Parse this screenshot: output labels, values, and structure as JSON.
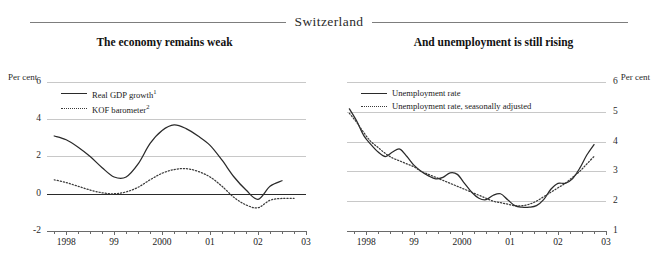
{
  "banner": {
    "country": "Switzerland"
  },
  "panels": [
    {
      "id": "left",
      "title": "The economy remains weak",
      "unit_label": "Per cent",
      "legend": [
        {
          "style": "solid",
          "label": "Real GDP growth",
          "footnote": "1"
        },
        {
          "style": "dotted",
          "label": "KOF barometer",
          "footnote": "2"
        }
      ]
    },
    {
      "id": "right",
      "title": "And unemployment is still rising",
      "unit_label": "Per cent",
      "legend": [
        {
          "style": "solid",
          "label": "Unemployment rate",
          "footnote": ""
        },
        {
          "style": "dotted",
          "label": "Unemployment rate, seasonally adjusted",
          "footnote": ""
        }
      ]
    }
  ],
  "chart_data": [
    {
      "type": "line",
      "title": "The economy remains weak",
      "xlabel": "",
      "ylabel": "Per cent",
      "ylim": [
        -2,
        6
      ],
      "yticks": [
        6,
        4,
        2,
        0,
        -2
      ],
      "xlim": [
        1997.6,
        2003.0
      ],
      "xticks": [
        1998,
        1999,
        2000,
        2001,
        2002,
        2003
      ],
      "xticklabels": [
        "1998",
        "99",
        "2000",
        "01",
        "02",
        "03"
      ],
      "grid": true,
      "zero_line": 0,
      "legend_position": "upper-left",
      "series": [
        {
          "name": "Real GDP growth",
          "style": "solid",
          "x": [
            1997.75,
            1998.0,
            1998.25,
            1998.5,
            1998.75,
            1999.0,
            1999.25,
            1999.5,
            1999.75,
            2000.0,
            2000.25,
            2000.5,
            2000.75,
            2001.0,
            2001.25,
            2001.5,
            2001.75,
            2002.0,
            2002.25,
            2002.5
          ],
          "y": [
            3.1,
            2.9,
            2.5,
            2.0,
            1.4,
            0.9,
            0.9,
            1.6,
            2.7,
            3.4,
            3.7,
            3.5,
            3.1,
            2.6,
            1.8,
            0.9,
            0.2,
            -0.3,
            0.4,
            0.7
          ]
        },
        {
          "name": "KOF barometer",
          "style": "dotted",
          "x": [
            1997.75,
            1998.0,
            1998.25,
            1998.5,
            1998.75,
            1999.0,
            1999.25,
            1999.5,
            1999.75,
            2000.0,
            2000.25,
            2000.5,
            2000.75,
            2001.0,
            2001.25,
            2001.5,
            2001.75,
            2002.0,
            2002.25,
            2002.5,
            2002.75
          ],
          "y": [
            0.75,
            0.6,
            0.4,
            0.2,
            0.05,
            0.0,
            0.1,
            0.35,
            0.75,
            1.1,
            1.3,
            1.35,
            1.2,
            0.9,
            0.4,
            -0.2,
            -0.6,
            -0.75,
            -0.35,
            -0.25,
            -0.25
          ]
        }
      ]
    },
    {
      "type": "line",
      "title": "And unemployment is still rising",
      "xlabel": "",
      "ylabel": "Per cent",
      "ylim": [
        1,
        6
      ],
      "yticks": [
        6,
        5,
        4,
        3,
        2,
        1
      ],
      "xlim": [
        1997.6,
        2003.0
      ],
      "xticks": [
        1998,
        1999,
        2000,
        2001,
        2002,
        2003
      ],
      "xticklabels": [
        "1998",
        "99",
        "2000",
        "01",
        "02",
        "03"
      ],
      "grid": true,
      "legend_position": "upper-left",
      "series": [
        {
          "name": "Unemployment rate",
          "style": "solid",
          "x": [
            1997.65,
            1997.8,
            1997.95,
            1998.1,
            1998.25,
            1998.4,
            1998.55,
            1998.7,
            1998.85,
            1999.0,
            1999.15,
            1999.3,
            1999.45,
            1999.6,
            1999.75,
            1999.9,
            2000.05,
            2000.2,
            2000.35,
            2000.5,
            2000.65,
            2000.8,
            2000.95,
            2001.1,
            2001.25,
            2001.4,
            2001.55,
            2001.7,
            2001.85,
            2002.0,
            2002.15,
            2002.3,
            2002.45,
            2002.6,
            2002.75
          ],
          "y": [
            5.1,
            4.7,
            4.2,
            3.9,
            3.65,
            3.5,
            3.65,
            3.75,
            3.5,
            3.2,
            3.0,
            2.85,
            2.75,
            2.8,
            2.95,
            2.9,
            2.6,
            2.3,
            2.1,
            2.05,
            2.2,
            2.25,
            2.05,
            1.85,
            1.8,
            1.8,
            1.85,
            2.05,
            2.4,
            2.6,
            2.6,
            2.75,
            3.1,
            3.55,
            3.9
          ]
        },
        {
          "name": "Unemployment rate, seasonally adjusted",
          "style": "dotted",
          "x": [
            1997.65,
            1997.8,
            1997.95,
            1998.1,
            1998.25,
            1998.4,
            1998.55,
            1998.7,
            1998.85,
            1999.0,
            1999.15,
            1999.3,
            1999.45,
            1999.6,
            1999.75,
            1999.9,
            2000.05,
            2000.2,
            2000.35,
            2000.5,
            2000.65,
            2000.8,
            2000.95,
            2001.1,
            2001.25,
            2001.4,
            2001.55,
            2001.7,
            2001.85,
            2002.0,
            2002.15,
            2002.3,
            2002.45,
            2002.6,
            2002.75
          ],
          "y": [
            4.95,
            4.65,
            4.3,
            4.0,
            3.8,
            3.6,
            3.45,
            3.35,
            3.25,
            3.15,
            3.0,
            2.9,
            2.8,
            2.7,
            2.6,
            2.5,
            2.4,
            2.3,
            2.2,
            2.1,
            2.0,
            1.95,
            1.9,
            1.85,
            1.85,
            1.9,
            2.0,
            2.15,
            2.3,
            2.45,
            2.6,
            2.8,
            3.0,
            3.25,
            3.5
          ]
        }
      ]
    }
  ]
}
